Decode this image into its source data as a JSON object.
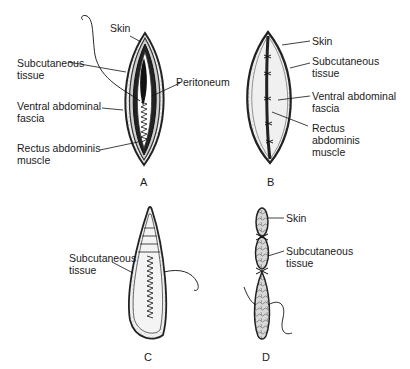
{
  "panels": [
    {
      "id": "A",
      "letter": "A",
      "labels": {
        "skin": "Skin",
        "subcutaneous": "Subcutaneous\ntissue",
        "peritoneum": "Peritoneum",
        "fascia": "Ventral abdominal\nfascia",
        "rectus": "Rectus abdominis\nmuscle"
      }
    },
    {
      "id": "B",
      "letter": "B",
      "labels": {
        "skin": "Skin",
        "subcutaneous": "Subcutaneous\ntissue",
        "fascia": "Ventral abdominal\nfascia",
        "rectus": "Rectus\nabdominis\nmuscle"
      }
    },
    {
      "id": "C",
      "letter": "C",
      "labels": {
        "subcutaneous": "Subcutaneous\ntissue"
      }
    },
    {
      "id": "D",
      "letter": "D",
      "labels": {
        "skin": "Skin",
        "subcutaneous": "Subcutaneous\ntissue"
      }
    }
  ]
}
